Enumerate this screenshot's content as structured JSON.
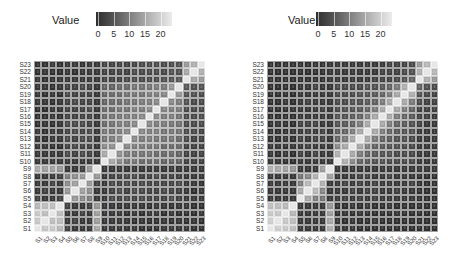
{
  "chart_data": [
    {
      "type": "heatmap",
      "title": "",
      "legend": {
        "title": "Value",
        "ticks": [
          0,
          5,
          10,
          15,
          20
        ],
        "range": [
          0,
          23
        ],
        "colormap": "gray dark-to-light"
      },
      "x": [
        "S1",
        "S2",
        "S3",
        "S4",
        "S5",
        "S6",
        "S7",
        "S8",
        "S9",
        "S10",
        "S11",
        "S12",
        "S13",
        "S14",
        "S15",
        "S16",
        "S17",
        "S18",
        "S19",
        "S20",
        "S21",
        "S22",
        "S23"
      ],
      "y": [
        "S1",
        "S2",
        "S3",
        "S4",
        "S5",
        "S6",
        "S7",
        "S8",
        "S9",
        "S10",
        "S11",
        "S12",
        "S13",
        "S14",
        "S15",
        "S16",
        "S17",
        "S18",
        "S19",
        "S20",
        "S21",
        "S22",
        "S23"
      ],
      "xlabel": "",
      "ylabel": "",
      "note": "rows listed S1..S23; values approximate (cell labels illegible)",
      "values": [
        [
          22,
          18,
          18,
          16,
          2,
          1,
          1,
          1,
          14,
          1,
          1,
          1,
          1,
          1,
          0,
          0,
          0,
          1,
          1,
          1,
          1,
          0,
          0
        ],
        [
          18,
          22,
          17,
          17,
          1,
          2,
          1,
          1,
          13,
          1,
          1,
          1,
          1,
          0,
          1,
          0,
          0,
          1,
          0,
          1,
          0,
          1,
          0
        ],
        [
          18,
          17,
          22,
          17,
          1,
          1,
          2,
          1,
          13,
          1,
          1,
          1,
          0,
          1,
          0,
          1,
          1,
          0,
          1,
          0,
          0,
          0,
          1
        ],
        [
          16,
          17,
          17,
          22,
          2,
          1,
          1,
          2,
          12,
          1,
          1,
          0,
          1,
          1,
          1,
          0,
          1,
          1,
          0,
          1,
          1,
          0,
          0
        ],
        [
          2,
          1,
          1,
          2,
          22,
          12,
          10,
          9,
          1,
          1,
          3,
          2,
          3,
          2,
          3,
          2,
          2,
          2,
          3,
          2,
          1,
          1,
          1
        ],
        [
          1,
          2,
          1,
          1,
          12,
          22,
          13,
          11,
          1,
          1,
          2,
          3,
          2,
          3,
          3,
          2,
          2,
          3,
          2,
          2,
          1,
          0,
          1
        ],
        [
          1,
          1,
          2,
          1,
          10,
          13,
          22,
          12,
          2,
          1,
          3,
          2,
          3,
          2,
          3,
          2,
          2,
          2,
          2,
          3,
          1,
          1,
          0
        ],
        [
          1,
          1,
          1,
          2,
          9,
          11,
          12,
          22,
          12,
          1,
          2,
          2,
          3,
          3,
          2,
          2,
          3,
          2,
          2,
          2,
          1,
          1,
          1
        ],
        [
          14,
          13,
          13,
          12,
          1,
          1,
          2,
          12,
          22,
          1,
          1,
          1,
          1,
          1,
          1,
          1,
          1,
          1,
          1,
          1,
          1,
          1,
          1
        ],
        [
          1,
          1,
          1,
          1,
          1,
          1,
          1,
          1,
          1,
          22,
          14,
          10,
          8,
          8,
          7,
          7,
          7,
          6,
          6,
          6,
          2,
          2,
          2
        ],
        [
          1,
          1,
          1,
          1,
          3,
          2,
          3,
          2,
          1,
          14,
          22,
          11,
          9,
          8,
          8,
          8,
          7,
          7,
          7,
          6,
          2,
          2,
          2
        ],
        [
          1,
          1,
          0,
          0,
          2,
          3,
          2,
          2,
          1,
          10,
          11,
          22,
          10,
          9,
          9,
          8,
          8,
          7,
          7,
          7,
          2,
          2,
          2
        ],
        [
          1,
          0,
          1,
          1,
          3,
          2,
          3,
          3,
          1,
          8,
          9,
          10,
          22,
          10,
          9,
          9,
          8,
          8,
          8,
          7,
          3,
          2,
          2
        ],
        [
          1,
          0,
          1,
          1,
          2,
          3,
          2,
          3,
          1,
          8,
          8,
          9,
          10,
          22,
          10,
          9,
          9,
          8,
          8,
          8,
          3,
          3,
          2
        ],
        [
          0,
          1,
          0,
          1,
          3,
          3,
          3,
          2,
          1,
          7,
          8,
          9,
          9,
          10,
          22,
          10,
          9,
          9,
          8,
          8,
          3,
          3,
          3
        ],
        [
          0,
          0,
          1,
          0,
          2,
          2,
          2,
          2,
          1,
          7,
          8,
          8,
          9,
          9,
          10,
          22,
          10,
          9,
          9,
          8,
          3,
          3,
          3
        ],
        [
          0,
          0,
          1,
          1,
          2,
          2,
          2,
          3,
          1,
          7,
          7,
          8,
          8,
          9,
          9,
          10,
          22,
          10,
          9,
          9,
          3,
          3,
          3
        ],
        [
          1,
          1,
          0,
          1,
          2,
          3,
          2,
          2,
          1,
          6,
          7,
          7,
          8,
          8,
          9,
          9,
          10,
          22,
          10,
          9,
          4,
          3,
          3
        ],
        [
          1,
          0,
          1,
          0,
          3,
          2,
          2,
          2,
          1,
          6,
          7,
          7,
          8,
          8,
          8,
          9,
          9,
          10,
          22,
          12,
          4,
          4,
          3
        ],
        [
          1,
          1,
          0,
          1,
          2,
          2,
          3,
          2,
          1,
          6,
          6,
          7,
          7,
          8,
          8,
          8,
          9,
          9,
          12,
          22,
          5,
          4,
          4
        ],
        [
          1,
          0,
          0,
          1,
          1,
          1,
          1,
          1,
          1,
          2,
          2,
          2,
          3,
          3,
          3,
          3,
          3,
          4,
          4,
          5,
          22,
          14,
          12
        ],
        [
          0,
          1,
          0,
          0,
          1,
          0,
          1,
          1,
          1,
          2,
          2,
          2,
          2,
          3,
          3,
          3,
          3,
          3,
          4,
          4,
          14,
          22,
          15
        ],
        [
          0,
          0,
          1,
          0,
          1,
          1,
          0,
          1,
          1,
          2,
          2,
          2,
          2,
          2,
          3,
          3,
          3,
          3,
          3,
          4,
          12,
          15,
          22
        ]
      ]
    },
    {
      "type": "heatmap",
      "title": "",
      "legend": {
        "title": "Value",
        "ticks": [
          0,
          5,
          10,
          15,
          20
        ],
        "range": [
          0,
          23
        ],
        "colormap": "gray dark-to-light"
      },
      "x": [
        "S1",
        "S2",
        "S3",
        "S4",
        "S5",
        "S6",
        "S7",
        "S8",
        "S9",
        "S10",
        "S11",
        "S12",
        "S13",
        "S14",
        "S15",
        "S16",
        "S17",
        "S18",
        "S19",
        "S20",
        "S21",
        "S22",
        "S23"
      ],
      "y": [
        "S1",
        "S2",
        "S3",
        "S4",
        "S5",
        "S6",
        "S7",
        "S8",
        "S9",
        "S10",
        "S11",
        "S12",
        "S13",
        "S14",
        "S15",
        "S16",
        "S17",
        "S18",
        "S19",
        "S20",
        "S21",
        "S22",
        "S23"
      ],
      "xlabel": "",
      "ylabel": "",
      "note": "rows listed S1..S23; values approximate (cell labels illegible)",
      "values": [
        [
          22,
          19,
          18,
          17,
          1,
          1,
          1,
          1,
          15,
          1,
          1,
          1,
          0,
          0,
          0,
          0,
          0,
          0,
          0,
          0,
          0,
          0,
          0
        ],
        [
          19,
          22,
          18,
          17,
          1,
          1,
          1,
          1,
          14,
          1,
          0,
          1,
          0,
          0,
          1,
          0,
          0,
          0,
          0,
          0,
          0,
          0,
          0
        ],
        [
          18,
          18,
          22,
          16,
          1,
          1,
          1,
          1,
          13,
          0,
          1,
          0,
          1,
          0,
          0,
          0,
          0,
          1,
          0,
          0,
          0,
          0,
          0
        ],
        [
          17,
          17,
          16,
          22,
          1,
          1,
          1,
          1,
          12,
          0,
          0,
          1,
          0,
          1,
          0,
          0,
          1,
          0,
          0,
          0,
          0,
          0,
          0
        ],
        [
          1,
          1,
          1,
          1,
          22,
          14,
          9,
          8,
          1,
          1,
          2,
          1,
          2,
          1,
          2,
          1,
          1,
          1,
          1,
          1,
          0,
          0,
          0
        ],
        [
          1,
          1,
          1,
          1,
          14,
          22,
          16,
          10,
          1,
          1,
          1,
          2,
          1,
          2,
          2,
          1,
          1,
          2,
          1,
          1,
          0,
          0,
          0
        ],
        [
          1,
          1,
          1,
          1,
          9,
          16,
          22,
          15,
          1,
          1,
          2,
          1,
          2,
          1,
          2,
          1,
          1,
          1,
          1,
          2,
          0,
          0,
          0
        ],
        [
          1,
          1,
          1,
          1,
          8,
          10,
          15,
          22,
          13,
          1,
          1,
          1,
          2,
          2,
          1,
          1,
          2,
          1,
          1,
          1,
          0,
          0,
          0
        ],
        [
          15,
          14,
          13,
          12,
          1,
          1,
          1,
          13,
          22,
          1,
          1,
          1,
          1,
          1,
          1,
          1,
          1,
          1,
          1,
          1,
          1,
          1,
          1
        ],
        [
          1,
          1,
          0,
          0,
          1,
          1,
          1,
          1,
          1,
          22,
          15,
          10,
          6,
          5,
          4,
          4,
          3,
          3,
          3,
          3,
          1,
          1,
          1
        ],
        [
          1,
          0,
          1,
          0,
          2,
          1,
          2,
          1,
          1,
          15,
          22,
          14,
          9,
          6,
          5,
          4,
          4,
          3,
          3,
          3,
          1,
          1,
          1
        ],
        [
          1,
          1,
          0,
          1,
          1,
          2,
          1,
          1,
          1,
          10,
          14,
          22,
          14,
          9,
          6,
          5,
          4,
          4,
          3,
          3,
          1,
          1,
          1
        ],
        [
          0,
          0,
          1,
          0,
          2,
          1,
          2,
          2,
          1,
          6,
          9,
          14,
          22,
          14,
          9,
          6,
          5,
          4,
          4,
          3,
          1,
          1,
          1
        ],
        [
          0,
          0,
          0,
          1,
          1,
          2,
          1,
          2,
          1,
          5,
          6,
          9,
          14,
          22,
          14,
          9,
          6,
          5,
          4,
          4,
          1,
          1,
          1
        ],
        [
          0,
          1,
          0,
          0,
          2,
          2,
          2,
          1,
          1,
          4,
          5,
          6,
          9,
          14,
          22,
          14,
          9,
          6,
          5,
          4,
          2,
          1,
          1
        ],
        [
          0,
          0,
          0,
          0,
          1,
          1,
          1,
          1,
          1,
          4,
          4,
          5,
          6,
          9,
          14,
          22,
          14,
          9,
          6,
          5,
          2,
          2,
          1
        ],
        [
          0,
          0,
          0,
          1,
          1,
          1,
          1,
          2,
          1,
          3,
          4,
          4,
          5,
          6,
          9,
          14,
          22,
          14,
          9,
          6,
          2,
          2,
          2
        ],
        [
          0,
          0,
          1,
          0,
          1,
          2,
          1,
          1,
          1,
          3,
          3,
          4,
          4,
          5,
          6,
          9,
          14,
          22,
          14,
          9,
          3,
          2,
          2
        ],
        [
          0,
          0,
          0,
          0,
          1,
          1,
          1,
          1,
          1,
          3,
          3,
          3,
          4,
          4,
          5,
          6,
          9,
          14,
          22,
          15,
          4,
          3,
          2
        ],
        [
          0,
          0,
          0,
          0,
          1,
          1,
          2,
          1,
          1,
          3,
          3,
          3,
          3,
          4,
          4,
          5,
          6,
          9,
          15,
          22,
          6,
          4,
          3
        ],
        [
          0,
          0,
          0,
          0,
          0,
          0,
          0,
          0,
          1,
          1,
          1,
          1,
          1,
          1,
          2,
          2,
          2,
          3,
          4,
          6,
          22,
          15,
          12
        ],
        [
          0,
          0,
          0,
          0,
          0,
          0,
          0,
          0,
          1,
          1,
          1,
          1,
          1,
          1,
          1,
          2,
          2,
          2,
          3,
          4,
          15,
          22,
          16
        ],
        [
          0,
          0,
          0,
          0,
          0,
          0,
          0,
          0,
          1,
          1,
          1,
          1,
          1,
          1,
          1,
          1,
          2,
          2,
          2,
          3,
          12,
          16,
          22
        ]
      ]
    }
  ],
  "panels": [
    {
      "legend_title": "Value",
      "ticks": [
        "0",
        "5",
        "10",
        "15",
        "20"
      ]
    },
    {
      "legend_title": "Value",
      "ticks": [
        "0",
        "5",
        "10",
        "15",
        "20"
      ]
    }
  ]
}
